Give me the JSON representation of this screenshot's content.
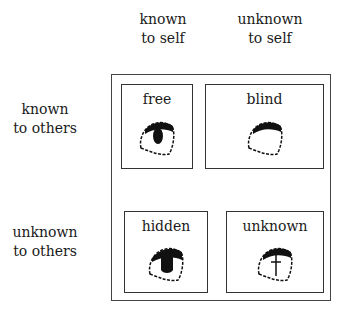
{
  "columns": [
    {
      "line1": "known",
      "line2": "to self"
    },
    {
      "line1": "unknown",
      "line2": "to self"
    }
  ],
  "rows": [
    {
      "line1": "known",
      "line2": "to others"
    },
    {
      "line1": "unknown",
      "line2": "to others"
    }
  ],
  "quadrants": [
    {
      "label": "free",
      "icon": "eye-open-icon"
    },
    {
      "label": "blind",
      "icon": "eye-empty-icon"
    },
    {
      "label": "hidden",
      "icon": "eye-dark-icon"
    },
    {
      "label": "unknown",
      "icon": "eye-crossed-icon"
    }
  ]
}
